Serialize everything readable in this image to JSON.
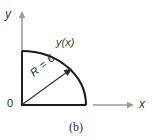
{
  "figure": {
    "caption": "(b)",
    "background_color": "#ffffff",
    "axes": {
      "y_label": "y",
      "x_label": "x",
      "axis_color": "#9a9a9a",
      "label_color": "#3b3b3b"
    },
    "annotations": {
      "curve_label": "y(x)",
      "origin_label": "0",
      "radius_label": "R = 6"
    },
    "shape": {
      "outline_color": "#1a1a1a",
      "radius_value": 6
    }
  }
}
